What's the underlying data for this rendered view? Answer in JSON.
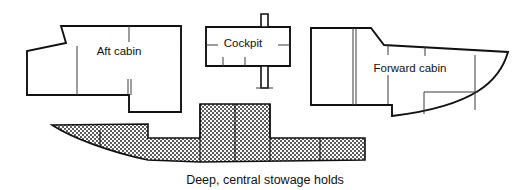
{
  "figure": {
    "kind": "boat-deck-plan-and-hull-profile",
    "background_color": "#ffffff",
    "outline_color": "#111111",
    "divider_color": "#3a3a3a",
    "hatch_color": "#6f6f6f",
    "caption": "Deep, central stowage holds"
  },
  "plan": {
    "aft_cabin": {
      "label": "Aft cabin",
      "label_x": 119,
      "label_y": 52
    },
    "cockpit": {
      "label": "Cockpit",
      "label_x": 243,
      "label_y": 44
    },
    "forward_cabin": {
      "label": "Forward cabin",
      "label_x": 410,
      "label_y": 69
    }
  },
  "hull": {
    "caption": "Deep, central stowage holds",
    "caption_x": 265,
    "caption_y": 181
  }
}
